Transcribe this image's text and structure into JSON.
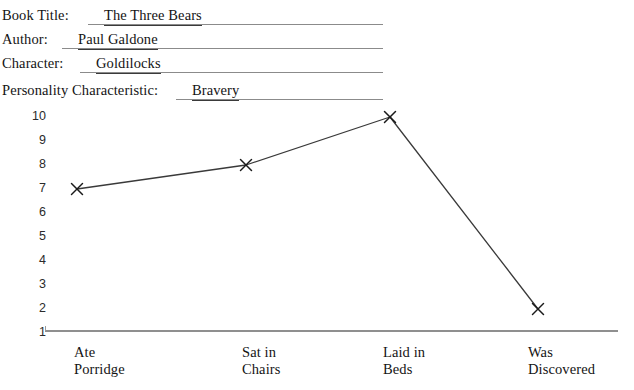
{
  "document": {
    "kind": "character-personality-chart-worksheet"
  },
  "form": {
    "fields": [
      {
        "label": "Book Title:",
        "value": "The Three Bears",
        "label_x": 2,
        "rule_x": 88,
        "rule_w": 295,
        "value_x": 104
      },
      {
        "label": "Author:",
        "value": "Paul Galdone",
        "label_x": 2,
        "rule_x": 62,
        "rule_w": 321,
        "value_x": 78
      },
      {
        "label": "Character:",
        "value": "Goldilocks",
        "label_x": 2,
        "rule_x": 80,
        "rule_w": 303,
        "value_x": 96
      },
      {
        "label": "Personality Characteristic:",
        "value": "Bravery",
        "label_x": 2,
        "rule_x": 176,
        "rule_w": 207,
        "value_x": 192
      }
    ]
  },
  "chart_data": {
    "type": "line",
    "title": "",
    "xlabel": "",
    "ylabel": "",
    "categories": [
      "Ate Porridge",
      "Sat in Chairs",
      "Laid in Beds",
      "Was Discovered"
    ],
    "category_lines": [
      [
        "Ate",
        "Porridge"
      ],
      [
        "Sat in",
        "Chairs"
      ],
      [
        "Laid in",
        "Beds"
      ],
      [
        "Was",
        "Discovered"
      ]
    ],
    "values": [
      7,
      8,
      10,
      2
    ],
    "point_marker": "x",
    "series": [
      {
        "name": "Bravery",
        "values": [
          7,
          8,
          10,
          2
        ]
      }
    ],
    "y_ticks": [
      10,
      9,
      8,
      7,
      6,
      5,
      4,
      3,
      2,
      1
    ],
    "ylim": [
      1,
      10
    ],
    "grid": false,
    "legend": "none",
    "axis_color": "#8b8b8b",
    "line_color": "#2b2b2b",
    "marker_color": "#1a1a1a"
  },
  "geometry": {
    "y_top_px": 13,
    "y_step_px": 24.0,
    "x_positions": [
      77,
      246,
      390,
      538
    ],
    "axis_y_px": 227,
    "axis_x_start": 45,
    "axis_x_end": 618,
    "x_label_x": [
      74,
      242,
      383,
      528
    ],
    "x_label_y": 240
  }
}
